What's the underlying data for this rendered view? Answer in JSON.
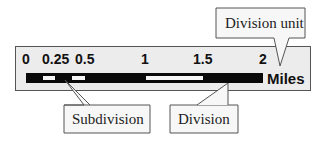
{
  "diagram": {
    "scale_bar": {
      "tick_labels": [
        "0",
        "0.25",
        "0.5",
        "1",
        "1.5",
        "2"
      ],
      "unit": "Miles",
      "segments": [
        {
          "from": 0,
          "to": 0.125,
          "color": "black"
        },
        {
          "from": 0.125,
          "to": 0.25,
          "color": "white"
        },
        {
          "from": 0.25,
          "to": 0.375,
          "color": "black"
        },
        {
          "from": 0.375,
          "to": 0.5,
          "color": "white"
        },
        {
          "from": 0.5,
          "to": 1,
          "color": "black"
        },
        {
          "from": 1,
          "to": 1.5,
          "color": "white"
        },
        {
          "from": 1.5,
          "to": 2,
          "color": "black"
        }
      ]
    },
    "callouts": {
      "division_unit": "Division unit",
      "subdivision": "Subdivision",
      "division": "Division"
    },
    "colors": {
      "panel_background": "#ececec",
      "bar_dark": "#0a0a0a",
      "bar_light": "#f4f4f4",
      "callout_background": "#f7f7f7",
      "outline": "#555555"
    }
  }
}
